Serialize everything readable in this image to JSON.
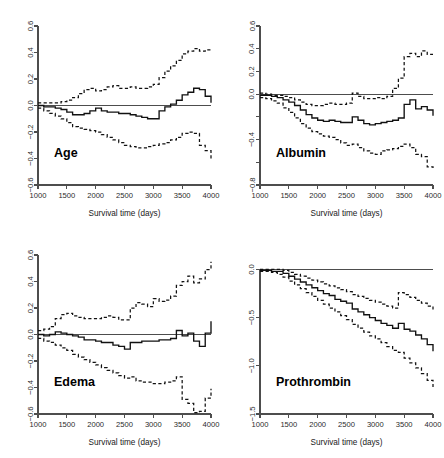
{
  "figure": {
    "layout": "2x2 panel grid of functional coefficient plots",
    "background": "#ffffff",
    "line_color": "#111111",
    "axis_color": "#4d4d4d"
  },
  "chart_data": [
    {
      "type": "line",
      "title": "Age",
      "xlabel": "Survival time (days)",
      "ylabel": "",
      "xlim": [
        1000,
        4000
      ],
      "ylim": [
        -0.6,
        0.6
      ],
      "grid": false,
      "legend": "none",
      "xticks": [
        1000,
        1500,
        2000,
        2500,
        3000,
        3500,
        4000
      ],
      "xticklabels": [
        "1000",
        "1500",
        "2000",
        "2500",
        "3000",
        "3500",
        "4000"
      ],
      "yticks": [
        -0.6,
        -0.4,
        -0.2,
        0.0,
        0.2,
        0.4,
        0.6
      ],
      "yticklabels": [
        "-0.6",
        "-0.4",
        "-0.2",
        "0.0",
        "0.2",
        "0.4",
        "0.6"
      ],
      "annotations": [
        "horizontal reference line at y = 0"
      ],
      "x": [
        1000,
        1100,
        1200,
        1300,
        1400,
        1500,
        1600,
        1700,
        1800,
        1900,
        2000,
        2100,
        2200,
        2300,
        2400,
        2500,
        2600,
        2700,
        2800,
        2900,
        3000,
        3100,
        3200,
        3300,
        3400,
        3500,
        3600,
        3700,
        3800,
        3900,
        4000
      ],
      "series": [
        {
          "name": "estimate",
          "style": "solid step",
          "values": [
            0.0,
            -0.01,
            -0.01,
            -0.02,
            -0.03,
            -0.05,
            -0.07,
            -0.07,
            -0.06,
            -0.04,
            -0.02,
            -0.04,
            -0.05,
            -0.05,
            -0.06,
            -0.06,
            -0.07,
            -0.08,
            -0.09,
            -0.1,
            -0.1,
            -0.04,
            -0.01,
            0.01,
            0.04,
            0.08,
            0.1,
            0.13,
            0.12,
            0.07,
            0.02
          ]
        },
        {
          "name": "upper 95% CI",
          "style": "dashed",
          "values": [
            0.02,
            0.02,
            0.02,
            0.02,
            0.03,
            0.04,
            0.06,
            0.09,
            0.12,
            0.13,
            0.11,
            0.12,
            0.14,
            0.15,
            0.13,
            0.13,
            0.14,
            0.13,
            0.13,
            0.14,
            0.16,
            0.21,
            0.26,
            0.3,
            0.34,
            0.39,
            0.41,
            0.43,
            0.41,
            0.42,
            0.43
          ]
        },
        {
          "name": "lower 95% CI",
          "style": "dashed",
          "values": [
            -0.02,
            -0.04,
            -0.06,
            -0.08,
            -0.1,
            -0.13,
            -0.16,
            -0.17,
            -0.18,
            -0.19,
            -0.2,
            -0.22,
            -0.24,
            -0.26,
            -0.28,
            -0.3,
            -0.31,
            -0.32,
            -0.32,
            -0.31,
            -0.3,
            -0.29,
            -0.28,
            -0.26,
            -0.24,
            -0.21,
            -0.2,
            -0.21,
            -0.3,
            -0.34,
            -0.4
          ]
        }
      ]
    },
    {
      "type": "line",
      "title": "Albumin",
      "xlabel": "Survival time (days)",
      "ylabel": "",
      "xlim": [
        1000,
        4000
      ],
      "ylim": [
        -0.8,
        0.6
      ],
      "grid": false,
      "legend": "none",
      "xticks": [
        1000,
        1500,
        2000,
        2500,
        3000,
        3500,
        4000
      ],
      "xticklabels": [
        "1000",
        "1500",
        "2000",
        "2500",
        "3000",
        "3500",
        "4000"
      ],
      "yticks": [
        -0.8,
        -0.6,
        -0.4,
        -0.2,
        0.0,
        0.2,
        0.4,
        0.6
      ],
      "yticklabels": [
        "-0.8",
        "",
        "-0.4",
        "",
        "0.0",
        "0.2",
        "0.4",
        "0.6"
      ],
      "annotations": [
        "horizontal reference line at y = 0"
      ],
      "x": [
        1000,
        1100,
        1200,
        1300,
        1400,
        1500,
        1600,
        1700,
        1800,
        1900,
        2000,
        2100,
        2200,
        2300,
        2400,
        2500,
        2600,
        2700,
        2800,
        2900,
        3000,
        3100,
        3200,
        3300,
        3400,
        3500,
        3600,
        3700,
        3800,
        3900,
        4000
      ],
      "series": [
        {
          "name": "estimate",
          "style": "solid step",
          "values": [
            -0.01,
            -0.01,
            -0.02,
            -0.03,
            -0.05,
            -0.07,
            -0.1,
            -0.14,
            -0.18,
            -0.21,
            -0.23,
            -0.24,
            -0.23,
            -0.24,
            -0.25,
            -0.25,
            -0.2,
            -0.23,
            -0.26,
            -0.27,
            -0.26,
            -0.25,
            -0.24,
            -0.23,
            -0.21,
            -0.09,
            -0.05,
            -0.13,
            -0.11,
            -0.14,
            -0.19
          ]
        },
        {
          "name": "upper 95% CI",
          "style": "dashed",
          "values": [
            0.01,
            0.0,
            -0.01,
            -0.01,
            -0.02,
            -0.03,
            -0.05,
            -0.07,
            -0.09,
            -0.1,
            -0.1,
            -0.09,
            -0.08,
            -0.09,
            -0.09,
            -0.08,
            0.01,
            -0.02,
            -0.04,
            -0.04,
            -0.03,
            -0.04,
            -0.02,
            0.05,
            0.14,
            0.33,
            0.36,
            0.33,
            0.38,
            0.35,
            0.35
          ]
        },
        {
          "name": "lower 95% CI",
          "style": "dashed",
          "values": [
            -0.03,
            -0.04,
            -0.06,
            -0.08,
            -0.12,
            -0.16,
            -0.21,
            -0.26,
            -0.3,
            -0.33,
            -0.35,
            -0.37,
            -0.38,
            -0.4,
            -0.43,
            -0.45,
            -0.44,
            -0.47,
            -0.5,
            -0.52,
            -0.53,
            -0.5,
            -0.49,
            -0.48,
            -0.46,
            -0.44,
            -0.47,
            -0.53,
            -0.55,
            -0.64,
            -0.65
          ]
        }
      ]
    },
    {
      "type": "line",
      "title": "Edema",
      "xlabel": "Survival time (days)",
      "ylabel": "",
      "xlim": [
        1000,
        4000
      ],
      "ylim": [
        -0.6,
        0.6
      ],
      "grid": false,
      "legend": "none",
      "xticks": [
        1000,
        1500,
        2000,
        2500,
        3000,
        3500,
        4000
      ],
      "xticklabels": [
        "1000",
        "1500",
        "2000",
        "2500",
        "3000",
        "3500",
        "4000"
      ],
      "yticks": [
        -0.6,
        -0.4,
        -0.2,
        0.0,
        0.2,
        0.4,
        0.6
      ],
      "yticklabels": [
        "-0.6",
        "-0.4",
        "-0.2",
        "0.0",
        "0.2",
        "0.4",
        "0.6"
      ],
      "annotations": [
        "horizontal reference line at y = 0"
      ],
      "x": [
        1000,
        1100,
        1200,
        1300,
        1400,
        1500,
        1600,
        1700,
        1800,
        1900,
        2000,
        2100,
        2200,
        2300,
        2400,
        2500,
        2600,
        2700,
        2800,
        2900,
        3000,
        3100,
        3200,
        3300,
        3400,
        3500,
        3600,
        3700,
        3800,
        3900,
        4000
      ],
      "series": [
        {
          "name": "estimate",
          "style": "solid step",
          "values": [
            0.0,
            -0.01,
            0.0,
            0.02,
            0.01,
            0.0,
            -0.01,
            -0.02,
            -0.04,
            -0.04,
            -0.05,
            -0.06,
            -0.06,
            -0.08,
            -0.09,
            -0.11,
            -0.06,
            -0.06,
            -0.05,
            -0.05,
            -0.05,
            -0.04,
            -0.04,
            -0.03,
            0.03,
            -0.01,
            0.01,
            -0.05,
            -0.09,
            0.01,
            0.1
          ]
        },
        {
          "name": "upper 95% CI",
          "style": "dashed",
          "values": [
            0.03,
            0.04,
            0.06,
            0.12,
            0.15,
            0.16,
            0.14,
            0.13,
            0.12,
            0.12,
            0.12,
            0.13,
            0.14,
            0.13,
            0.11,
            0.11,
            0.2,
            0.24,
            0.23,
            0.21,
            0.27,
            0.25,
            0.26,
            0.29,
            0.37,
            0.4,
            0.44,
            0.39,
            0.42,
            0.49,
            0.55
          ]
        },
        {
          "name": "lower 95% CI",
          "style": "dashed",
          "values": [
            -0.03,
            -0.05,
            -0.06,
            -0.08,
            -0.1,
            -0.12,
            -0.15,
            -0.17,
            -0.19,
            -0.21,
            -0.23,
            -0.25,
            -0.27,
            -0.29,
            -0.31,
            -0.33,
            -0.32,
            -0.35,
            -0.36,
            -0.36,
            -0.37,
            -0.37,
            -0.36,
            -0.35,
            -0.32,
            -0.49,
            -0.52,
            -0.59,
            -0.58,
            -0.48,
            -0.41
          ]
        }
      ]
    },
    {
      "type": "line",
      "title": "Prothrombin",
      "xlabel": "Survival time (days)",
      "ylabel": "",
      "xlim": [
        1000,
        4000
      ],
      "ylim": [
        -1.5,
        0.15
      ],
      "grid": false,
      "legend": "none",
      "xticks": [
        1000,
        1500,
        2000,
        2500,
        3000,
        3500,
        4000
      ],
      "xticklabels": [
        "1000",
        "1500",
        "2000",
        "2500",
        "3000",
        "3500",
        "4000"
      ],
      "yticks": [
        -1.5,
        -1.0,
        -0.5,
        0.0
      ],
      "yticklabels": [
        "-1.5",
        "-1.0",
        "-0.5",
        "0.0"
      ],
      "annotations": [
        "horizontal reference line at y = 0"
      ],
      "x": [
        1000,
        1100,
        1200,
        1300,
        1400,
        1500,
        1600,
        1700,
        1800,
        1900,
        2000,
        2100,
        2200,
        2300,
        2400,
        2500,
        2600,
        2700,
        2800,
        2900,
        3000,
        3100,
        3200,
        3300,
        3400,
        3500,
        3600,
        3700,
        3800,
        3900,
        4000
      ],
      "series": [
        {
          "name": "estimate",
          "style": "solid step",
          "values": [
            -0.01,
            -0.01,
            -0.02,
            -0.02,
            -0.04,
            -0.07,
            -0.1,
            -0.13,
            -0.16,
            -0.19,
            -0.22,
            -0.25,
            -0.27,
            -0.31,
            -0.33,
            -0.35,
            -0.41,
            -0.44,
            -0.47,
            -0.5,
            -0.53,
            -0.56,
            -0.58,
            -0.61,
            -0.56,
            -0.62,
            -0.64,
            -0.68,
            -0.72,
            -0.78,
            -0.85
          ]
        },
        {
          "name": "upper 95% CI",
          "style": "dashed",
          "values": [
            0.0,
            0.0,
            0.0,
            0.0,
            -0.01,
            -0.03,
            -0.05,
            -0.07,
            -0.09,
            -0.11,
            -0.13,
            -0.15,
            -0.17,
            -0.19,
            -0.21,
            -0.23,
            -0.26,
            -0.28,
            -0.3,
            -0.32,
            -0.34,
            -0.36,
            -0.38,
            -0.4,
            -0.24,
            -0.26,
            -0.29,
            -0.32,
            -0.35,
            -0.38,
            -0.43
          ]
        },
        {
          "name": "lower 95% CI",
          "style": "dashed",
          "values": [
            -0.02,
            -0.02,
            -0.03,
            -0.05,
            -0.08,
            -0.12,
            -0.16,
            -0.2,
            -0.24,
            -0.28,
            -0.32,
            -0.36,
            -0.4,
            -0.44,
            -0.48,
            -0.52,
            -0.57,
            -0.61,
            -0.65,
            -0.69,
            -0.72,
            -0.76,
            -0.8,
            -0.84,
            -0.86,
            -0.92,
            -0.97,
            -1.02,
            -1.08,
            -1.15,
            -1.22
          ]
        }
      ]
    }
  ]
}
